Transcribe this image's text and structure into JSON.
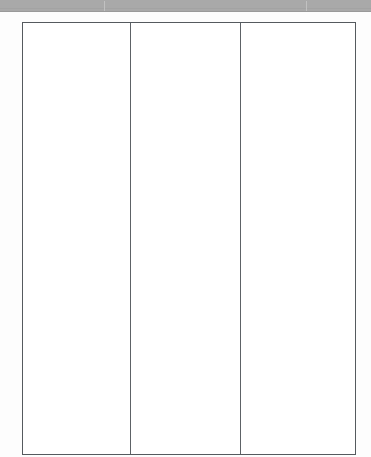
{
  "document": {
    "type": "scanned-page",
    "page_background": "#fdfdfd",
    "scan_strip_color": "#a9a9a9"
  },
  "top_bar": {
    "name": "scan-edge-strip",
    "ticks": [
      "tick-left",
      "tick-right"
    ]
  },
  "table": {
    "name": "three-column-table",
    "border_color": "#555a5e",
    "row_count": 1,
    "column_count": 3,
    "columns": [
      {
        "id": "column-1",
        "text": ""
      },
      {
        "id": "column-2",
        "text": ""
      },
      {
        "id": "column-3",
        "text": ""
      }
    ]
  }
}
